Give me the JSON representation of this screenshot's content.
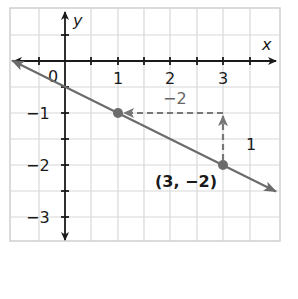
{
  "graph": {
    "axis_labels": {
      "x": "x",
      "y": "y"
    },
    "x_ticks": [
      {
        "value": 0,
        "label": "0"
      },
      {
        "value": 1,
        "label": "1"
      },
      {
        "value": 2,
        "label": "2"
      },
      {
        "value": 3,
        "label": "3"
      }
    ],
    "y_ticks": [
      {
        "value": -1,
        "label": "−1"
      },
      {
        "value": -2,
        "label": "−2"
      },
      {
        "value": -3,
        "label": "−3"
      }
    ],
    "line": {
      "through": [
        [
          1,
          -1
        ],
        [
          3,
          -2
        ]
      ],
      "slope": "-1/2"
    },
    "points": [
      {
        "x": 1,
        "y": -1
      },
      {
        "x": 3,
        "y": -2,
        "label": "(3, −2)"
      }
    ],
    "annotations": {
      "rise_label": "1",
      "run_label": "−2"
    },
    "colors": {
      "grid": "#d8d8d8",
      "axes": "#1a1a1a",
      "line": "#6b6b6b",
      "dashed": "#777777"
    }
  }
}
